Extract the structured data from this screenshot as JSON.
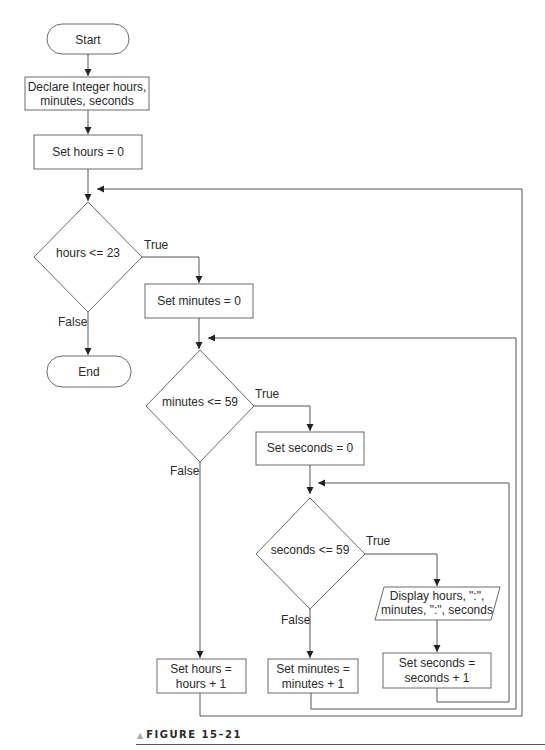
{
  "flowchart": {
    "start": "Start",
    "declare": [
      "Declare Integer hours,",
      "minutes, seconds"
    ],
    "set_hours": "Set hours = 0",
    "decision_hours": "hours <= 23",
    "set_minutes": "Set minutes = 0",
    "end": "End",
    "decision_minutes": "minutes <= 59",
    "set_seconds": "Set seconds = 0",
    "decision_seconds": "seconds <= 59",
    "display": [
      "Display hours, \":\",",
      "minutes, \":\", seconds"
    ],
    "inc_seconds": [
      "Set seconds =",
      "seconds + 1"
    ],
    "inc_minutes": [
      "Set minutes =",
      "minutes + 1"
    ],
    "inc_hours": [
      "Set hours =",
      "hours + 1"
    ],
    "labels": {
      "true": "True",
      "false": "False"
    }
  },
  "caption": {
    "marker": "▲",
    "text": "FIGURE 15–21"
  }
}
